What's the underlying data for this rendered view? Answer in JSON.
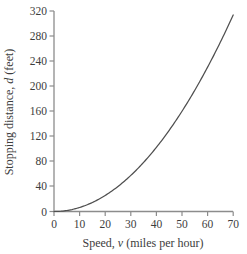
{
  "chart_data": {
    "type": "line",
    "title": "",
    "xlabel": "Speed, v (miles per hour)",
    "ylabel": "Stopping distance, d (feet)",
    "xlabel_parts": {
      "prefix": "Speed, ",
      "variable": "v",
      "suffix": " (miles per hour)"
    },
    "ylabel_parts": {
      "prefix": "Stopping distance, ",
      "variable": "d",
      "suffix": " (feet)"
    },
    "xlim": [
      0,
      70
    ],
    "ylim": [
      0,
      320
    ],
    "xticks": [
      0,
      10,
      20,
      30,
      40,
      50,
      60,
      70
    ],
    "yticks": [
      0,
      40,
      80,
      120,
      160,
      200,
      240,
      280,
      320
    ],
    "xtick_labels": [
      "0",
      "10",
      "20",
      "30",
      "40",
      "50",
      "60",
      "70"
    ],
    "ytick_labels": [
      "0",
      "40",
      "80",
      "120",
      "160",
      "200",
      "240",
      "280",
      "320"
    ],
    "grid": false,
    "legend": null,
    "legend_position": "none",
    "series": [
      {
        "name": "Stopping distance",
        "relation": "d = 0.064 v^2",
        "color": "#4a4a4a",
        "x": [
          0,
          5,
          10,
          15,
          20,
          25,
          30,
          35,
          40,
          45,
          50,
          55,
          60,
          65,
          70
        ],
        "values": [
          0,
          1.6,
          6.4,
          14.4,
          25.6,
          40,
          57.6,
          78.4,
          102.4,
          129.6,
          160,
          193.6,
          230.4,
          270.4,
          313.6
        ]
      }
    ],
    "axis_color": "#8c8c8c",
    "curve_color": "#4f4f4f"
  }
}
